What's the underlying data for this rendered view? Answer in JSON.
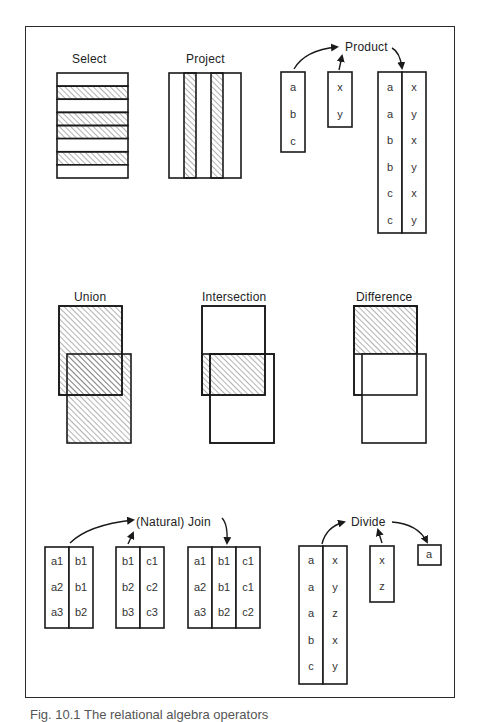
{
  "figure": {
    "caption_partial": "Fig. 10.1  The relational algebra operators",
    "caption_visibility": "partially cut off at bottom edge"
  },
  "colors": {
    "line": "#1a1a1a",
    "hatch": "#555555",
    "background": "#ffffff",
    "text": "#222222"
  },
  "operators": {
    "select": {
      "label": "Select",
      "rows": [
        false,
        true,
        false,
        true,
        true,
        false,
        true,
        false
      ]
    },
    "project": {
      "label": "Project",
      "columns": [
        false,
        true,
        false,
        true,
        false
      ]
    },
    "product": {
      "label": "Product",
      "left": [
        "a",
        "b",
        "c"
      ],
      "right": [
        "x",
        "y"
      ],
      "result": [
        [
          "a",
          "x"
        ],
        [
          "a",
          "y"
        ],
        [
          "b",
          "x"
        ],
        [
          "b",
          "y"
        ],
        [
          "c",
          "x"
        ],
        [
          "c",
          "y"
        ]
      ]
    },
    "union": {
      "label": "Union",
      "shaded": "both"
    },
    "intersection": {
      "label": "Intersection",
      "shaded": "overlap"
    },
    "difference": {
      "label": "Difference",
      "shaded": "first-minus-second"
    },
    "join": {
      "label": "(Natural) Join",
      "left": [
        [
          "a1",
          "b1"
        ],
        [
          "a2",
          "b1"
        ],
        [
          "a3",
          "b2"
        ]
      ],
      "right": [
        [
          "b1",
          "c1"
        ],
        [
          "b2",
          "c2"
        ],
        [
          "b3",
          "c3"
        ]
      ],
      "result": [
        [
          "a1",
          "b1",
          "c1"
        ],
        [
          "a2",
          "b1",
          "c1"
        ],
        [
          "a3",
          "b2",
          "c2"
        ]
      ]
    },
    "divide": {
      "label": "Divide",
      "dividend": [
        [
          "a",
          "x"
        ],
        [
          "a",
          "y"
        ],
        [
          "a",
          "z"
        ],
        [
          "b",
          "x"
        ],
        [
          "c",
          "y"
        ]
      ],
      "divisor": [
        "x",
        "z"
      ],
      "result": [
        "a"
      ]
    }
  }
}
